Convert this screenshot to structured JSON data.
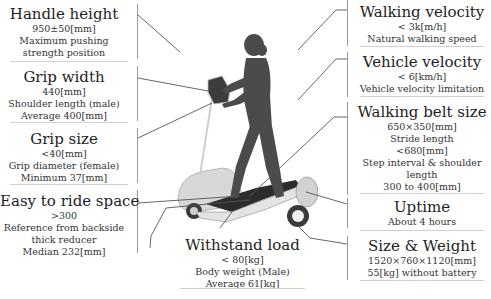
{
  "left_specs": [
    {
      "title": "Handle height",
      "lines": [
        "950±50[mm]",
        "Maximum pushing",
        "strength position"
      ]
    },
    {
      "title": "Grip width",
      "lines": [
        "440[mm]",
        "Shoulder length (male)",
        "Average 400[mm]"
      ]
    },
    {
      "title": "Grip size",
      "lines": [
        "<40[mm]",
        "Grip diameter (female)",
        "Minimum  37[mm]"
      ]
    },
    {
      "title": "Easy to ride space",
      "lines": [
        ">300",
        "Reference from backside",
        "thick reducer",
        "Median 232[mm]"
      ]
    }
  ],
  "right_specs": [
    {
      "title": "Walking velocity",
      "lines": [
        "< 3k[m/h]",
        "Natural walking speed"
      ]
    },
    {
      "title": "Vehicle velocity",
      "lines": [
        "< 6[km/h]",
        "Vehicle velocity limitation"
      ]
    },
    {
      "title": "Walking belt size",
      "lines": [
        "650×350[mm]",
        "Stride length",
        "<680[mm]",
        "Step interval & shoulder",
        "length",
        "300 to 400[mm]"
      ]
    },
    {
      "title": "Uptime",
      "lines": [
        "About 4 hours"
      ]
    },
    {
      "title": "Size & Weight",
      "lines": [
        "1520×760×1120[mm]",
        "55[kg] without battery"
      ]
    }
  ],
  "bottom_spec": {
    "title": "Withstand load",
    "lines": [
      "< 80[kg]",
      "Body weight (Male)",
      "Average 61[kg]"
    ]
  },
  "illustration": {
    "subject": "woman-walking-on-belt-scooter",
    "colors": {
      "silhouette": "#4a4a4a",
      "body_shell": "#d9d9d9",
      "belt": "#2e2e2e",
      "leader_line": "#555555"
    }
  }
}
